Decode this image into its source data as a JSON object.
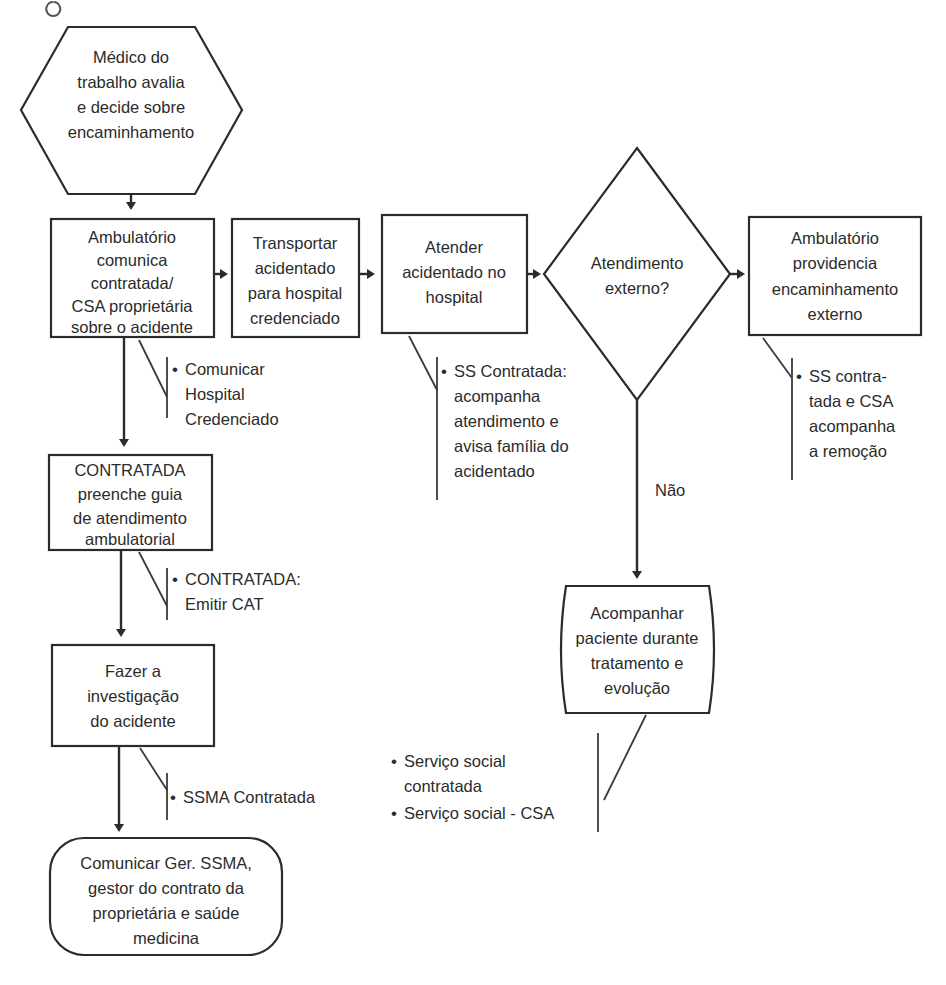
{
  "diagram": {
    "type": "flowchart",
    "language": "pt-BR",
    "background_color": "#ffffff",
    "line_color": "#2b2b2b",
    "text_color": "#2b2b2b"
  },
  "nodes": [
    {
      "id": "medico",
      "shape": "hexagon",
      "lines": [
        "Médico do",
        "trabalho avalia",
        "e decide sobre",
        "encaminhamento"
      ]
    },
    {
      "id": "ambulatorio-comunica",
      "shape": "rectangle",
      "lines": [
        "Ambulatório",
        "comunica",
        "contratada/",
        "CSA proprietária",
        "sobre o acidente"
      ]
    },
    {
      "id": "transportar",
      "shape": "rectangle",
      "lines": [
        "Transportar",
        "acidentado",
        "para hospital",
        "credenciado"
      ]
    },
    {
      "id": "atender",
      "shape": "rectangle",
      "lines": [
        "Atender",
        "acidentado no",
        "hospital"
      ]
    },
    {
      "id": "atendimento-externo",
      "shape": "diamond",
      "lines": [
        "Atendimento",
        "externo?"
      ]
    },
    {
      "id": "ambulatorio-providencia",
      "shape": "rectangle",
      "lines": [
        "Ambulatório",
        "providencia",
        "encaminhamento",
        "externo"
      ]
    },
    {
      "id": "contratada-guia",
      "shape": "rectangle",
      "lines": [
        "CONTRATADA",
        "preenche guia",
        "de atendimento",
        "ambulatorial"
      ]
    },
    {
      "id": "investigacao",
      "shape": "rectangle",
      "lines": [
        "Fazer a",
        "investigação",
        "do acidente"
      ]
    },
    {
      "id": "comunicar-ssma",
      "shape": "rounded-rectangle",
      "lines": [
        "Comunicar Ger. SSMA,",
        "gestor do contrato da",
        "proprietária e saúde",
        "medicina"
      ]
    },
    {
      "id": "acompanhar-paciente",
      "shape": "barrel",
      "lines": [
        "Acompanhar",
        "paciente durante",
        "tratamento e",
        "evolução"
      ]
    }
  ],
  "notes": [
    {
      "id": "note-comunicar-hospital",
      "attached_to": "ambulatorio-comunica",
      "bullets": [
        {
          "lines": [
            "Comunicar",
            "Hospital",
            "Credenciado"
          ]
        }
      ]
    },
    {
      "id": "note-contratada-cat",
      "attached_to": "contratada-guia",
      "bullets": [
        {
          "lines": [
            "CONTRATADA:",
            "Emitir CAT"
          ]
        }
      ]
    },
    {
      "id": "note-ssma-contratada",
      "attached_to": "investigacao",
      "bullets": [
        {
          "lines": [
            "SSMA Contratada"
          ]
        }
      ]
    },
    {
      "id": "note-ss-contratada-hospital",
      "attached_to": "atender",
      "bullets": [
        {
          "lines": [
            "SS Contratada:",
            "acompanha",
            "atendimento e",
            "avisa família do",
            "acidentado"
          ]
        }
      ]
    },
    {
      "id": "note-ss-contratada-remocao",
      "attached_to": "ambulatorio-providencia",
      "bullets": [
        {
          "lines": [
            "SS contra-",
            "tada e CSA",
            "acompanha",
            "a remoção"
          ]
        }
      ]
    },
    {
      "id": "note-servico-social",
      "attached_to": "acompanhar-paciente",
      "bullets": [
        {
          "lines": [
            "Serviço social",
            "contratada"
          ]
        },
        {
          "lines": [
            "Serviço social - CSA"
          ]
        }
      ]
    }
  ],
  "edge_labels": [
    {
      "id": "edge-label-nao",
      "text": "Não",
      "from": "atendimento-externo",
      "to": "acompanhar-paciente"
    }
  ],
  "bullet_glyph": "•"
}
